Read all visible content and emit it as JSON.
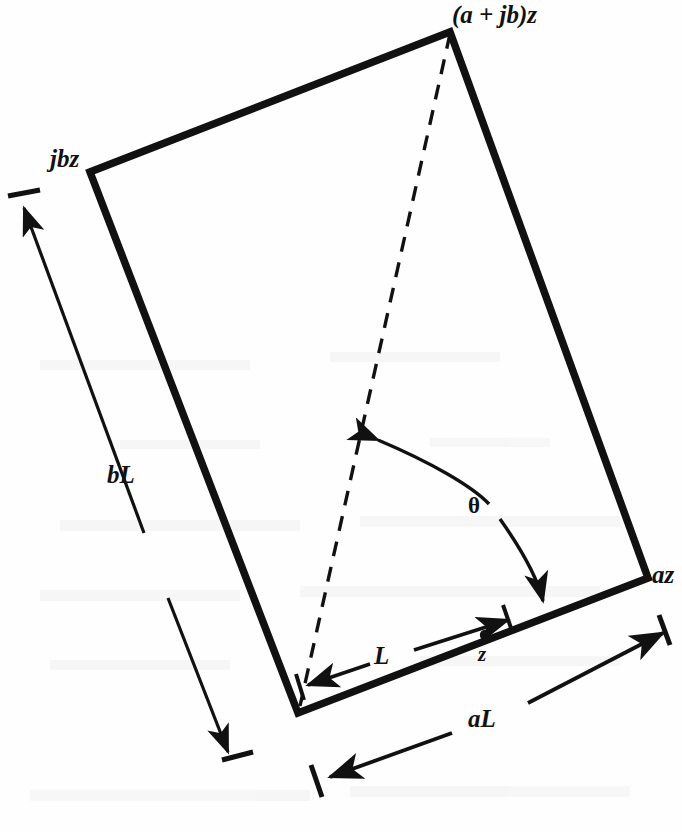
{
  "figure": {
    "background_color": "#fefefe",
    "ink_color": "#111111",
    "labels": {
      "top_vertex": "(a + jb)z",
      "left_vertex": "jbz",
      "right_vertex": "az",
      "side_b": "bL",
      "side_a": "aL",
      "segment_L": "L",
      "point_z": "z",
      "angle": "θ"
    },
    "icons": {
      "arrow": "arrow-head-icon",
      "tick": "extension-tick-icon",
      "dot": "point-marker-icon"
    },
    "geometry": {
      "parallelogram_vertices": [
        {
          "name": "bottom-left-origin",
          "x": 298,
          "y": 713
        },
        {
          "name": "left-jbz",
          "x": 90,
          "y": 172
        },
        {
          "name": "top-a-plus-jb-z",
          "x": 450,
          "y": 32
        },
        {
          "name": "right-az",
          "x": 648,
          "y": 578
        }
      ],
      "diagonal_dashed": {
        "from": {
          "x": 450,
          "y": 32
        },
        "to": {
          "x": 300,
          "y": 706
        }
      },
      "angle_arc": {
        "from": {
          "x": 374,
          "y": 437
        },
        "to": {
          "x": 546,
          "y": 606
        },
        "double_headed": true
      },
      "dimension_bL": {
        "from": {
          "x": 233,
          "y": 750
        },
        "to": {
          "x": 20,
          "y": 202
        }
      },
      "dimension_aL": {
        "from": {
          "x": 323,
          "y": 779
        },
        "to": {
          "x": 665,
          "y": 631
        }
      },
      "dimension_L": {
        "from": {
          "x": 305,
          "y": 685
        },
        "to": {
          "x": 480,
          "y": 628
        }
      },
      "point_z_marker": {
        "x": 485,
        "y": 635
      }
    }
  }
}
